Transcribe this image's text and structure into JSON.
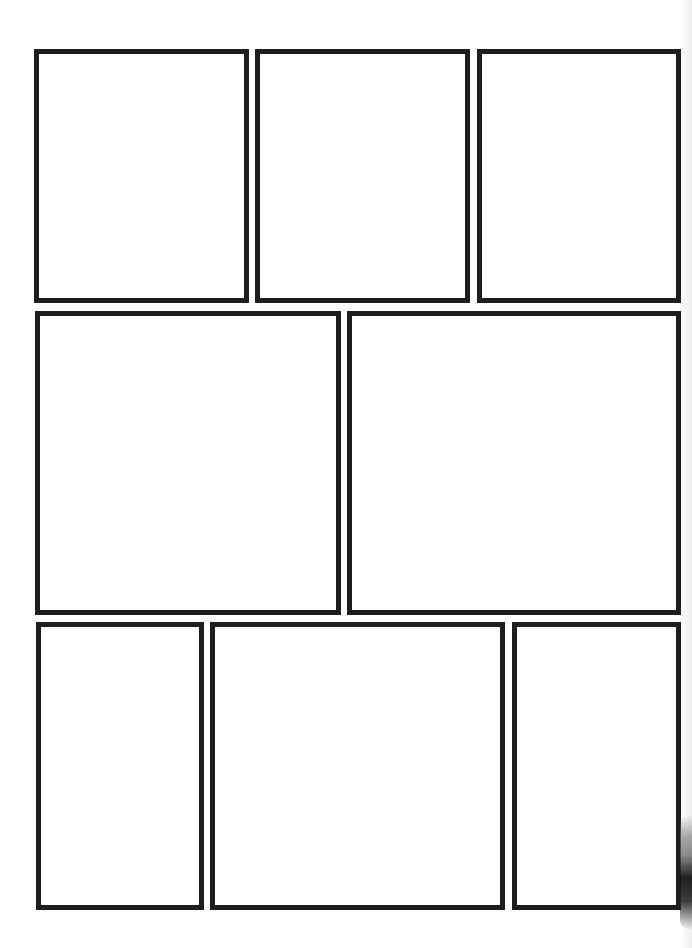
{
  "page": {
    "type": "blank comic page template",
    "background_color": "#ffffff",
    "border_color": "#1e1e1e",
    "rows": [
      {
        "row": 1,
        "panels": [
          {
            "id": "panel-1",
            "x": 34,
            "y": 49,
            "w": 215,
            "h": 254
          },
          {
            "id": "panel-2",
            "x": 255,
            "y": 49,
            "w": 215,
            "h": 254
          },
          {
            "id": "panel-3",
            "x": 477,
            "y": 49,
            "w": 204,
            "h": 254
          }
        ]
      },
      {
        "row": 2,
        "panels": [
          {
            "id": "panel-4",
            "x": 35,
            "y": 311,
            "w": 306,
            "h": 304
          },
          {
            "id": "panel-5",
            "x": 347,
            "y": 311,
            "w": 334,
            "h": 304
          }
        ]
      },
      {
        "row": 3,
        "panels": [
          {
            "id": "panel-6",
            "x": 36,
            "y": 622,
            "w": 168,
            "h": 288
          },
          {
            "id": "panel-7",
            "x": 210,
            "y": 622,
            "w": 295,
            "h": 288
          },
          {
            "id": "panel-8",
            "x": 512,
            "y": 622,
            "w": 169,
            "h": 288
          }
        ]
      }
    ]
  }
}
